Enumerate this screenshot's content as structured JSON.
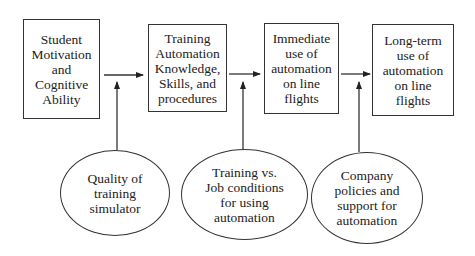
{
  "diagram": {
    "type": "flow-model",
    "boxes": [
      {
        "id": "student-motivation",
        "label": "Student\nMotivation\nand\nCognitive\nAbility"
      },
      {
        "id": "training-automation",
        "label": "Training\nAutomation\nKnowledge,\nSkills, and\nprocedures"
      },
      {
        "id": "immediate-use",
        "label": "Immediate\nuse of\nautomation\non line\nflights"
      },
      {
        "id": "long-term-use",
        "label": "Long-term\nuse of\nautomation\non line\nflights"
      }
    ],
    "moderators": [
      {
        "id": "simulator-quality",
        "label": "Quality of\ntraining\nsimulator",
        "targets_arrow": "student-motivation -> training-automation"
      },
      {
        "id": "training-vs-job",
        "label": "Training vs.\nJob conditions\nfor using\nautomation",
        "targets_arrow": "training-automation -> immediate-use"
      },
      {
        "id": "company-policies",
        "label": "Company\npolicies and\nsupport for\nautomation",
        "targets_arrow": "immediate-use -> long-term-use"
      }
    ],
    "edges": [
      {
        "from": "student-motivation",
        "to": "training-automation"
      },
      {
        "from": "training-automation",
        "to": "immediate-use"
      },
      {
        "from": "immediate-use",
        "to": "long-term-use"
      }
    ],
    "colors": {
      "stroke": "#333333",
      "background": "#ffffff",
      "text": "#222222"
    }
  }
}
